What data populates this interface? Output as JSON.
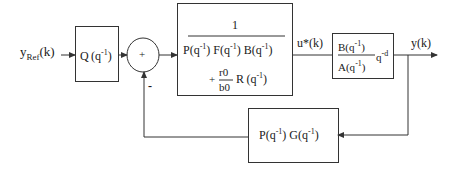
{
  "diagram": {
    "type": "block-diagram",
    "input": {
      "label": "y",
      "subscript": "Ref",
      "suffix": "(k)"
    },
    "blocks": [
      {
        "id": "Q",
        "label": "Q",
        "arg": "(q",
        "exp": "-1",
        "close": ")"
      },
      {
        "id": "controller",
        "numerator": "1",
        "denominator_line1": [
          {
            "f": "P",
            "arg": "(q",
            "exp": "-1",
            "close": ")"
          },
          {
            "f": "F",
            "arg": "(q",
            "exp": "-1",
            "close": ")"
          },
          {
            "f": "B",
            "arg": "(q",
            "exp": "-1",
            "close": ")"
          }
        ],
        "denominator_line2": {
          "plus": "+",
          "r0": "r0",
          "b0": "b0",
          "f": "R",
          "arg": "(q",
          "exp": "-1",
          "close": ")"
        }
      },
      {
        "id": "plant",
        "numerator": {
          "f": "B",
          "arg": "(q",
          "exp": "-1",
          "close": ")"
        },
        "denominator": {
          "f": "A",
          "arg": "(q",
          "exp": "-1",
          "close": ")"
        },
        "delay": "q",
        "delay_exp": "-d"
      },
      {
        "id": "feedback",
        "parts": [
          {
            "f": "P",
            "arg": "(q",
            "exp": "-1",
            "close": ")"
          },
          {
            "f": "G",
            "arg": "(q",
            "exp": "-1",
            "close": ")"
          }
        ]
      }
    ],
    "summing_junction": {
      "plus_sign": "+",
      "minus_sign": "-"
    },
    "signals": {
      "control": "u*(k)",
      "output": "y(k)"
    },
    "colors": {
      "stroke": "#333333",
      "background": "#ffffff",
      "text": "#1a1a1a"
    }
  }
}
